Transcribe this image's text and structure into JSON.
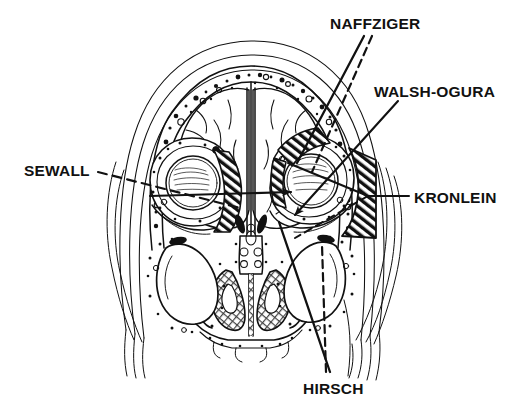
{
  "figure": {
    "type": "anatomical-line-diagram",
    "view": "coronal section through orbits and paranasal sinuses",
    "line_color": "#111111",
    "background_color": "#ffffff",
    "fill_style": "black-and-white diagonal hatching"
  },
  "labels": [
    {
      "id": "naffziger",
      "text": "NAFFZIGER",
      "x": 330,
      "y": 16,
      "leader": "solid-and-dashed pair to superior orbital rim / roof",
      "target": "orbital roof, transcranial superior approach"
    },
    {
      "id": "walsh_ogura",
      "text": "WALSH-OGURA",
      "x": 374,
      "y": 84,
      "leader": "solid arrow to orbital floor",
      "target": "orbital floor via maxillary antrum"
    },
    {
      "id": "kronlein",
      "text": "KRONLEIN",
      "x": 414,
      "y": 190,
      "leader": "forked solid and dashed branches to lateral orbital wall",
      "target": "lateral orbital wall"
    },
    {
      "id": "sewall",
      "text": "SEWALL",
      "x": 24,
      "y": 163,
      "leader": "dashed line with solid arrow crossing to medial orbital wall",
      "target": "medial orbital wall / ethmoid"
    },
    {
      "id": "hirsch",
      "text": "HIRSCH",
      "x": 303,
      "y": 381,
      "leader": "solid and dashed pair rising to inferior orbit",
      "target": "inferior orbital floor, transantral approach"
    }
  ],
  "anatomy": {
    "regions": [
      "scalp and calvarium layers",
      "diploe with stippled marrow",
      "frontal lobes of brain",
      "falx cerebri / midline septum",
      "left orbit with globe",
      "right orbit with globe",
      "ethmoid air cells",
      "nasal septum",
      "nasal turbinates",
      "maxillary sinuses",
      "hard palate / alveolar ridge"
    ],
    "hatched_zones": [
      "left medial orbital wedge",
      "right superomedial orbital wedge",
      "right lateral orbital wall block"
    ]
  }
}
